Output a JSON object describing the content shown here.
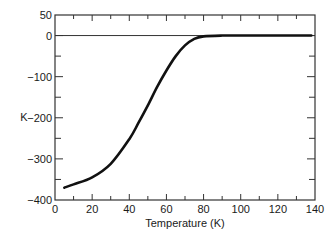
{
  "chart_data": {
    "type": "line",
    "title": "",
    "xlabel": "Temperature (K)",
    "ylabel": "K",
    "xlim": [
      0,
      140
    ],
    "ylim": [
      -400,
      50
    ],
    "xticks": [
      0,
      20,
      40,
      60,
      80,
      100,
      120,
      140
    ],
    "yticks": [
      50,
      0,
      -100,
      -200,
      -300,
      -400
    ],
    "grid": false,
    "legend": null,
    "reference_line": {
      "y": 0
    },
    "series": [
      {
        "name": "K",
        "x": [
          5,
          10,
          20,
          30,
          40,
          45,
          50,
          55,
          60,
          65,
          70,
          75,
          80,
          90,
          100,
          120,
          138
        ],
        "y": [
          -370,
          -362,
          -345,
          -312,
          -252,
          -212,
          -170,
          -125,
          -85,
          -50,
          -24,
          -8,
          -2,
          0,
          0,
          0,
          0
        ]
      }
    ]
  },
  "axis": {
    "y_tick_labels": [
      "50",
      "0",
      "−100",
      "−200",
      "−300",
      "−400"
    ],
    "x_tick_labels": [
      "0",
      "20",
      "40",
      "60",
      "80",
      "100",
      "120",
      "140"
    ],
    "x_title": "Temperature (K)",
    "y_title": "K"
  },
  "colors": {
    "line": "#111111",
    "axis": "#333333",
    "background": "#ffffff"
  }
}
